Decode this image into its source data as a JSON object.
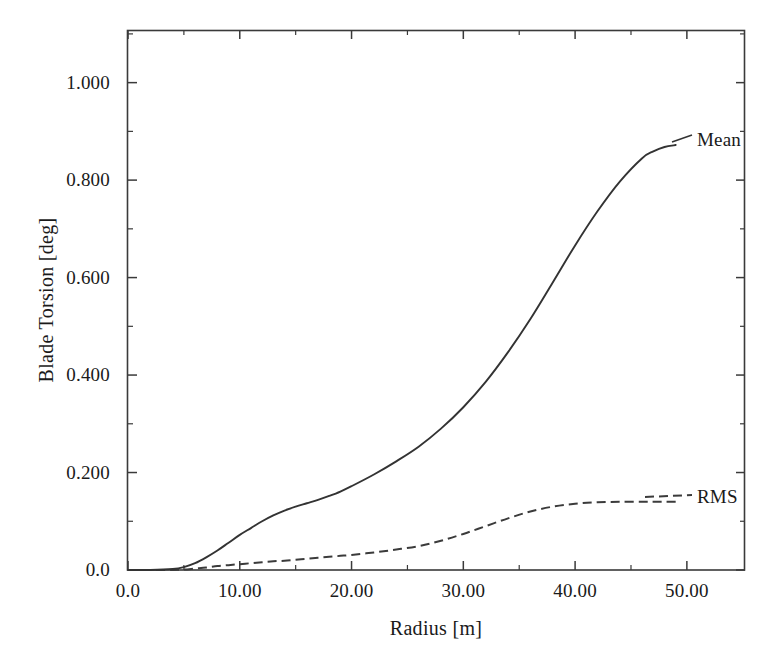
{
  "figure": {
    "background": "#ffffff",
    "ink_color": "#333333"
  },
  "axes": {
    "x_title": "Radius [m]",
    "y_title": "Blade Torsion [deg]",
    "x_tick_labels": [
      "0.0",
      "10.00",
      "20.00",
      "30.00",
      "40.00",
      "50.00"
    ],
    "y_tick_labels": [
      "0.0",
      "0.200",
      "0.400",
      "0.600",
      "0.800",
      "1.000"
    ]
  },
  "series_labels": {
    "mean": "Mean",
    "rms": "RMS"
  },
  "chart_data": {
    "type": "line",
    "title": "",
    "xlabel": "Radius [m]",
    "ylabel": "Blade Torsion [deg]",
    "xlim": [
      0.0,
      55.2
    ],
    "ylim": [
      0.0,
      1.108
    ],
    "x_ticks": [
      0.0,
      10.0,
      20.0,
      30.0,
      40.0,
      50.0
    ],
    "x_tick_labels": [
      "0.0",
      "10.00",
      "20.00",
      "30.00",
      "40.00",
      "50.00"
    ],
    "y_ticks": [
      0.0,
      0.2,
      0.4,
      0.6,
      0.8,
      1.0
    ],
    "y_tick_labels": [
      "0.0",
      "0.200",
      "0.400",
      "0.600",
      "0.800",
      "1.000"
    ],
    "x_minor_ticks": [
      5.0,
      15.0,
      25.0,
      35.0,
      45.0
    ],
    "y_minor_ticks": [
      0.1,
      0.3,
      0.5,
      0.7,
      0.9,
      1.1
    ],
    "grid": false,
    "legend": "inline-right-end-labels",
    "x": [
      0,
      2,
      4,
      5,
      6,
      7,
      8,
      9,
      10,
      11,
      12,
      13,
      14,
      15,
      16,
      17,
      18,
      19,
      20,
      22,
      24,
      26,
      28,
      30,
      32,
      34,
      36,
      38,
      40,
      42,
      44,
      46,
      47,
      48,
      49
    ],
    "series": [
      {
        "name": "Mean",
        "style": "solid",
        "color": "#333333",
        "values": [
          0.0,
          0.0,
          0.002,
          0.006,
          0.014,
          0.026,
          0.04,
          0.056,
          0.072,
          0.086,
          0.1,
          0.112,
          0.122,
          0.13,
          0.137,
          0.144,
          0.152,
          0.161,
          0.172,
          0.196,
          0.223,
          0.253,
          0.29,
          0.334,
          0.386,
          0.447,
          0.515,
          0.59,
          0.666,
          0.736,
          0.797,
          0.845,
          0.859,
          0.868,
          0.872
        ]
      },
      {
        "name": "RMS",
        "style": "dashed",
        "color": "#3b3b3b",
        "values": [
          0.0,
          0.0,
          0.0,
          0.001,
          0.003,
          0.005,
          0.008,
          0.01,
          0.012,
          0.014,
          0.016,
          0.018,
          0.019,
          0.021,
          0.023,
          0.025,
          0.027,
          0.029,
          0.031,
          0.036,
          0.042,
          0.049,
          0.06,
          0.074,
          0.09,
          0.106,
          0.12,
          0.13,
          0.136,
          0.139,
          0.14,
          0.14,
          0.14,
          0.14,
          0.14
        ]
      }
    ]
  }
}
